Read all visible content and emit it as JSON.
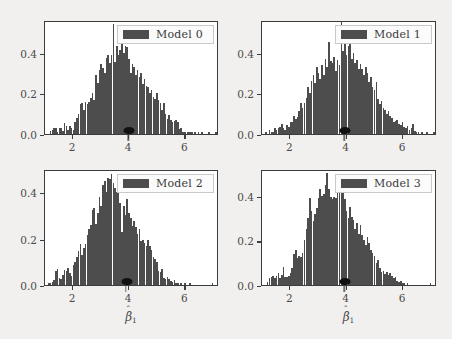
{
  "figure": {
    "background_color": "#f2f0ee",
    "panel_background": "#ffffff",
    "bar_color": "#4d4d4d",
    "marker_color": "#111111",
    "axis_color": "#3c3c3c"
  },
  "chart_data": [
    {
      "type": "bar",
      "title": "",
      "legend_label": "Model 0",
      "legend_position": "upper right",
      "xlabel": "",
      "ylabel": "",
      "xlim": [
        1.0,
        7.2
      ],
      "ylim": [
        0.0,
        0.56
      ],
      "xticks": [
        2,
        4,
        6
      ],
      "xtick_labels": [
        "2",
        "4",
        "6"
      ],
      "yticks": [
        0.0,
        0.2,
        0.4
      ],
      "ytick_labels": [
        "0.0",
        "0.2",
        "0.4"
      ],
      "grid": false,
      "true_value_marker": 4.0,
      "bin_width": 0.062,
      "x": [
        1.08,
        1.14,
        1.2,
        1.27,
        1.33,
        1.39,
        1.45,
        1.51,
        1.58,
        1.64,
        1.7,
        1.76,
        1.82,
        1.89,
        1.95,
        2.01,
        2.07,
        2.13,
        2.2,
        2.26,
        2.32,
        2.38,
        2.44,
        2.51,
        2.57,
        2.63,
        2.69,
        2.75,
        2.82,
        2.88,
        2.94,
        3.0,
        3.06,
        3.13,
        3.19,
        3.25,
        3.31,
        3.37,
        3.44,
        3.5,
        3.56,
        3.62,
        3.68,
        3.75,
        3.81,
        3.87,
        3.93,
        3.99,
        4.06,
        4.12,
        4.18,
        4.24,
        4.3,
        4.37,
        4.43,
        4.49,
        4.55,
        4.61,
        4.68,
        4.74,
        4.8,
        4.86,
        4.92,
        4.99,
        5.05,
        5.11,
        5.17,
        5.23,
        5.3,
        5.36,
        5.42,
        5.48,
        5.54,
        5.61,
        5.67,
        5.73,
        5.79,
        5.85,
        5.92,
        5.98,
        6.04,
        6.1,
        6.16,
        6.23,
        6.29,
        6.35,
        6.41,
        6.47,
        6.54,
        6.6,
        6.66,
        6.72,
        6.78,
        6.85,
        6.91,
        6.97,
        7.03,
        7.09
      ],
      "values": [
        0.0,
        0.0,
        0.014,
        0.018,
        0.03,
        0.032,
        0.012,
        0.03,
        0.028,
        0.016,
        0.055,
        0.04,
        0.02,
        0.04,
        0.03,
        0.018,
        0.06,
        0.08,
        0.1,
        0.145,
        0.15,
        0.12,
        0.155,
        0.148,
        0.155,
        0.175,
        0.2,
        0.165,
        0.29,
        0.25,
        0.315,
        0.345,
        0.325,
        0.3,
        0.375,
        0.39,
        0.35,
        0.39,
        0.54,
        0.355,
        0.43,
        0.39,
        0.415,
        0.445,
        0.4,
        0.43,
        0.425,
        0.37,
        0.3,
        0.345,
        0.33,
        0.29,
        0.315,
        0.28,
        0.3,
        0.245,
        0.27,
        0.235,
        0.23,
        0.2,
        0.215,
        0.18,
        0.17,
        0.2,
        0.165,
        0.15,
        0.12,
        0.15,
        0.1,
        0.075,
        0.095,
        0.07,
        0.06,
        0.065,
        0.07,
        0.06,
        0.025,
        0.03,
        0.01,
        0.012,
        0.0,
        0.012,
        0.008,
        0.01,
        0.0,
        0.012,
        0.0,
        0.01,
        0.0,
        0.008,
        0.0,
        0.0,
        0.0,
        0.008,
        0.0,
        0.0,
        0.0,
        0.01
      ]
    },
    {
      "type": "bar",
      "title": "",
      "legend_label": "Model 1",
      "legend_position": "upper right",
      "xlabel": "",
      "ylabel": "",
      "xlim": [
        1.0,
        7.2
      ],
      "ylim": [
        0.0,
        0.56
      ],
      "xticks": [
        2,
        4,
        6
      ],
      "xtick_labels": [
        "2",
        "4",
        "6"
      ],
      "yticks": [
        0.0,
        0.2,
        0.4
      ],
      "ytick_labels": [
        "0.0",
        "0.2",
        "0.4"
      ],
      "grid": false,
      "true_value_marker": 3.95,
      "bin_width": 0.062,
      "x": [
        1.08,
        1.14,
        1.2,
        1.27,
        1.33,
        1.39,
        1.45,
        1.51,
        1.58,
        1.64,
        1.7,
        1.76,
        1.82,
        1.89,
        1.95,
        2.01,
        2.07,
        2.13,
        2.2,
        2.26,
        2.32,
        2.38,
        2.44,
        2.51,
        2.57,
        2.63,
        2.69,
        2.75,
        2.82,
        2.88,
        2.94,
        3.0,
        3.06,
        3.13,
        3.19,
        3.25,
        3.31,
        3.37,
        3.44,
        3.5,
        3.56,
        3.62,
        3.68,
        3.75,
        3.81,
        3.87,
        3.93,
        3.99,
        4.06,
        4.12,
        4.18,
        4.24,
        4.3,
        4.37,
        4.43,
        4.49,
        4.55,
        4.61,
        4.68,
        4.74,
        4.8,
        4.86,
        4.92,
        4.99,
        5.05,
        5.11,
        5.17,
        5.23,
        5.3,
        5.36,
        5.42,
        5.48,
        5.54,
        5.61,
        5.67,
        5.73,
        5.79,
        5.85,
        5.92,
        5.98,
        6.04,
        6.1,
        6.16,
        6.23,
        6.29,
        6.35,
        6.41,
        6.47,
        6.54,
        6.6,
        6.66,
        6.72,
        6.78,
        6.85,
        6.91,
        6.97,
        7.03,
        7.09
      ],
      "values": [
        0.0,
        0.012,
        0.0,
        0.018,
        0.01,
        0.012,
        0.03,
        0.022,
        0.028,
        0.035,
        0.05,
        0.03,
        0.022,
        0.045,
        0.035,
        0.058,
        0.06,
        0.09,
        0.075,
        0.085,
        0.115,
        0.15,
        0.13,
        0.15,
        0.175,
        0.23,
        0.2,
        0.26,
        0.29,
        0.25,
        0.33,
        0.3,
        0.27,
        0.34,
        0.29,
        0.37,
        0.33,
        0.45,
        0.36,
        0.35,
        0.38,
        0.31,
        0.365,
        0.34,
        0.555,
        0.41,
        0.44,
        0.39,
        0.43,
        0.455,
        0.37,
        0.4,
        0.35,
        0.365,
        0.32,
        0.345,
        0.32,
        0.29,
        0.33,
        0.3,
        0.255,
        0.28,
        0.23,
        0.215,
        0.255,
        0.17,
        0.145,
        0.16,
        0.13,
        0.12,
        0.1,
        0.115,
        0.09,
        0.08,
        0.06,
        0.065,
        0.07,
        0.05,
        0.045,
        0.06,
        0.035,
        0.03,
        0.04,
        0.02,
        0.028,
        0.05,
        0.015,
        0.012,
        0.008,
        0.0,
        0.01,
        0.0,
        0.0,
        0.008,
        0.0,
        0.0,
        0.0,
        0.008
      ]
    },
    {
      "type": "bar",
      "title": "",
      "legend_label": "Model 2",
      "legend_position": "upper right",
      "xlabel": "β̂₁",
      "ylabel": "",
      "xlim": [
        1.0,
        7.2
      ],
      "ylim": [
        0.0,
        0.5
      ],
      "xticks": [
        2,
        4,
        6
      ],
      "xtick_labels": [
        "2",
        "4",
        "6"
      ],
      "yticks": [
        0.0,
        0.2,
        0.4
      ],
      "ytick_labels": [
        "0.0",
        "0.2",
        "0.4"
      ],
      "grid": false,
      "true_value_marker": 3.92,
      "bin_width": 0.062,
      "x": [
        1.08,
        1.14,
        1.2,
        1.27,
        1.33,
        1.39,
        1.45,
        1.51,
        1.58,
        1.64,
        1.7,
        1.76,
        1.82,
        1.89,
        1.95,
        2.01,
        2.07,
        2.13,
        2.2,
        2.26,
        2.32,
        2.38,
        2.44,
        2.51,
        2.57,
        2.63,
        2.69,
        2.75,
        2.82,
        2.88,
        2.94,
        3.0,
        3.06,
        3.13,
        3.19,
        3.25,
        3.31,
        3.37,
        3.44,
        3.5,
        3.56,
        3.62,
        3.68,
        3.75,
        3.81,
        3.87,
        3.93,
        3.99,
        4.06,
        4.12,
        4.18,
        4.24,
        4.3,
        4.37,
        4.43,
        4.49,
        4.55,
        4.61,
        4.68,
        4.74,
        4.8,
        4.86,
        4.92,
        4.99,
        5.05,
        5.11,
        5.17,
        5.23,
        5.3,
        5.36,
        5.42,
        5.48,
        5.54,
        5.61,
        5.67,
        5.73,
        5.79,
        5.85,
        5.92,
        5.98,
        6.04,
        6.1,
        6.16,
        6.23,
        6.29,
        6.35,
        6.41,
        6.47,
        6.54,
        6.6,
        6.66,
        6.72,
        6.78,
        6.85,
        6.91,
        6.97,
        7.03,
        7.09
      ],
      "values": [
        0.0,
        0.008,
        0.01,
        0.012,
        0.02,
        0.06,
        0.07,
        0.03,
        0.025,
        0.045,
        0.065,
        0.06,
        0.075,
        0.05,
        0.04,
        0.085,
        0.1,
        0.12,
        0.145,
        0.175,
        0.13,
        0.16,
        0.175,
        0.215,
        0.24,
        0.26,
        0.325,
        0.33,
        0.265,
        0.31,
        0.38,
        0.34,
        0.43,
        0.45,
        0.4,
        0.46,
        0.455,
        0.48,
        0.44,
        0.42,
        0.4,
        0.41,
        0.355,
        0.23,
        0.34,
        0.3,
        0.37,
        0.31,
        0.29,
        0.255,
        0.275,
        0.25,
        0.22,
        0.24,
        0.19,
        0.195,
        0.18,
        0.17,
        0.195,
        0.17,
        0.15,
        0.12,
        0.11,
        0.1,
        0.06,
        0.055,
        0.07,
        0.03,
        0.025,
        0.035,
        0.025,
        0.018,
        0.012,
        0.02,
        0.008,
        0.01,
        0.0,
        0.01,
        0.0,
        0.008,
        0.0,
        0.0,
        0.01,
        0.0,
        0.0,
        0.0,
        0.0,
        0.0,
        0.0,
        0.0,
        0.0,
        0.0,
        0.0,
        0.0,
        0.0,
        0.01,
        0.0,
        0.0
      ]
    },
    {
      "type": "bar",
      "title": "",
      "legend_label": "Model 3",
      "legend_position": "upper right",
      "xlabel": "β̂₁",
      "ylabel": "",
      "xlim": [
        1.0,
        7.2
      ],
      "ylim": [
        0.0,
        0.52
      ],
      "xticks": [
        2,
        4,
        6
      ],
      "xtick_labels": [
        "2",
        "4",
        "6"
      ],
      "yticks": [
        0.0,
        0.2,
        0.4
      ],
      "ytick_labels": [
        "0.0",
        "0.2",
        "0.4"
      ],
      "grid": false,
      "true_value_marker": 3.95,
      "bin_width": 0.062,
      "x": [
        1.08,
        1.14,
        1.2,
        1.27,
        1.33,
        1.39,
        1.45,
        1.51,
        1.58,
        1.64,
        1.7,
        1.76,
        1.82,
        1.89,
        1.95,
        2.01,
        2.07,
        2.13,
        2.2,
        2.26,
        2.32,
        2.38,
        2.44,
        2.51,
        2.57,
        2.63,
        2.69,
        2.75,
        2.82,
        2.88,
        2.94,
        3.0,
        3.06,
        3.13,
        3.19,
        3.25,
        3.31,
        3.37,
        3.44,
        3.5,
        3.56,
        3.62,
        3.68,
        3.75,
        3.81,
        3.87,
        3.93,
        3.99,
        4.06,
        4.12,
        4.18,
        4.24,
        4.3,
        4.37,
        4.43,
        4.49,
        4.55,
        4.61,
        4.68,
        4.74,
        4.8,
        4.86,
        4.92,
        4.99,
        5.05,
        5.11,
        5.17,
        5.23,
        5.3,
        5.36,
        5.42,
        5.48,
        5.54,
        5.61,
        5.67,
        5.73,
        5.79,
        5.85,
        5.92,
        5.98,
        6.04,
        6.1,
        6.16,
        6.23,
        6.29,
        6.35,
        6.41,
        6.47,
        6.54,
        6.6,
        6.66,
        6.72,
        6.78,
        6.85,
        6.91,
        6.97,
        7.03,
        7.09
      ],
      "values": [
        0.0,
        0.0,
        0.012,
        0.03,
        0.035,
        0.04,
        0.03,
        0.04,
        0.055,
        0.03,
        0.045,
        0.08,
        0.038,
        0.035,
        0.04,
        0.055,
        0.075,
        0.14,
        0.155,
        0.12,
        0.13,
        0.125,
        0.145,
        0.2,
        0.25,
        0.3,
        0.39,
        0.33,
        0.285,
        0.32,
        0.345,
        0.39,
        0.43,
        0.4,
        0.41,
        0.45,
        0.5,
        0.43,
        0.395,
        0.385,
        0.395,
        0.39,
        0.43,
        0.42,
        0.46,
        0.44,
        0.385,
        0.33,
        0.3,
        0.35,
        0.305,
        0.29,
        0.25,
        0.28,
        0.23,
        0.27,
        0.225,
        0.2,
        0.18,
        0.215,
        0.19,
        0.155,
        0.145,
        0.13,
        0.1,
        0.11,
        0.075,
        0.06,
        0.065,
        0.05,
        0.06,
        0.045,
        0.055,
        0.04,
        0.03,
        0.035,
        0.02,
        0.012,
        0.018,
        0.01,
        0.008,
        0.0,
        0.01,
        0.0,
        0.0,
        0.0,
        0.0,
        0.0,
        0.0,
        0.0,
        0.0,
        0.0,
        0.0,
        0.0,
        0.0,
        0.01,
        0.0,
        0.0
      ]
    }
  ],
  "panels": [
    {
      "legend_label": "Model 0",
      "xlabel": "",
      "ytick_labels": [
        "0.0",
        "0.2",
        "0.4"
      ],
      "xtick_labels": [
        "2",
        "4",
        "6"
      ]
    },
    {
      "legend_label": "Model 1",
      "xlabel": "",
      "ytick_labels": [
        "0.0",
        "0.2",
        "0.4"
      ],
      "xtick_labels": [
        "2",
        "4",
        "6"
      ]
    },
    {
      "legend_label": "Model 2",
      "xlabel": "β̂₁",
      "ytick_labels": [
        "0.0",
        "0.2",
        "0.4"
      ],
      "xtick_labels": [
        "2",
        "4",
        "6"
      ]
    },
    {
      "legend_label": "Model 3",
      "xlabel": "β̂₁",
      "ytick_labels": [
        "0.0",
        "0.2",
        "0.4"
      ],
      "xtick_labels": [
        "2",
        "4",
        "6"
      ]
    }
  ],
  "axis_labels": {
    "x_symbol_base": "β",
    "x_symbol_hat": "ˆ",
    "x_symbol_sub": "1"
  }
}
